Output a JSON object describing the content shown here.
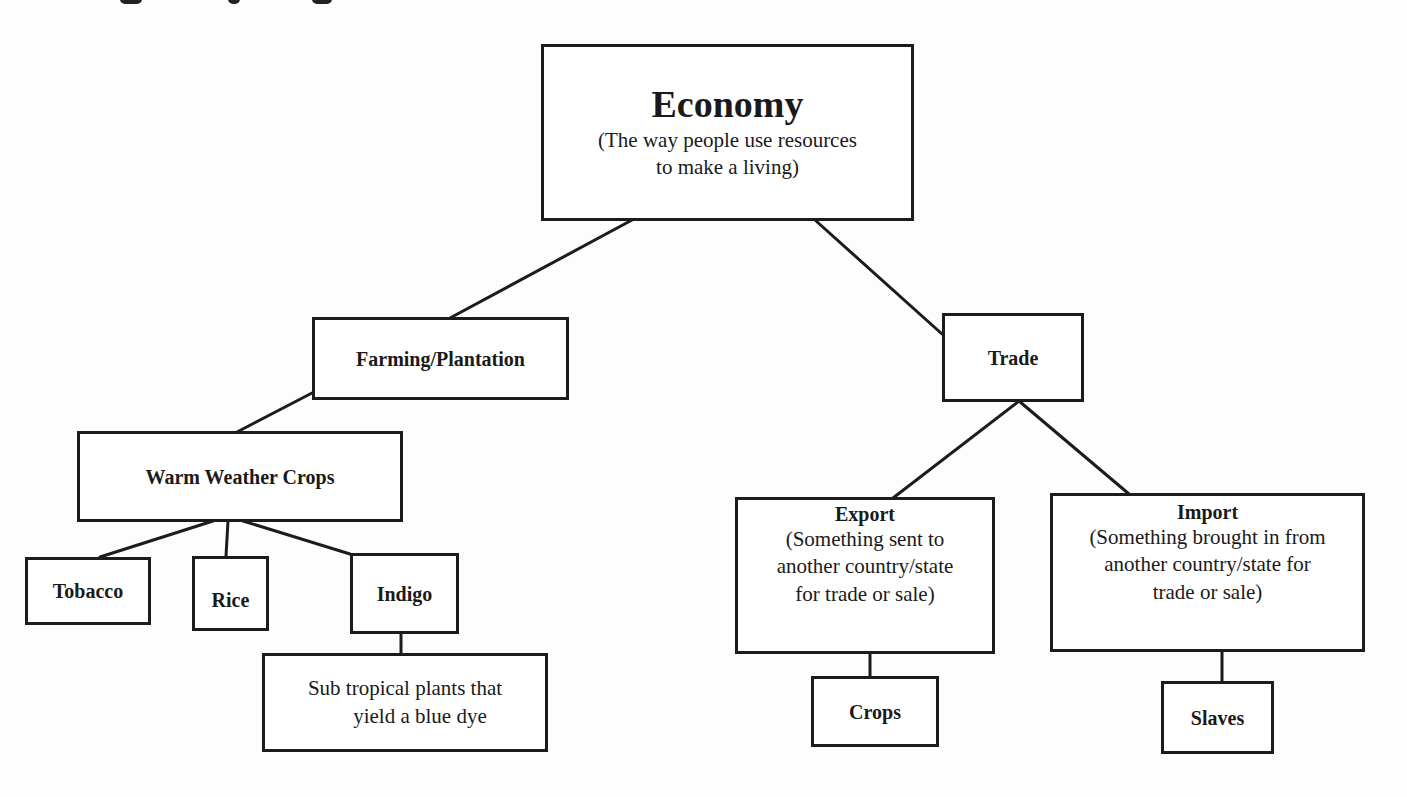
{
  "diagram": {
    "type": "concept-tree",
    "root": {
      "title": "Economy",
      "subtitle_line1": "(The way people use resources",
      "subtitle_line2": "to make a living)"
    },
    "farming": {
      "label": "Farming/Plantation",
      "warm_crops": {
        "label": "Warm Weather Crops",
        "children": [
          {
            "label": "Tobacco"
          },
          {
            "label": "Rice"
          },
          {
            "label": "Indigo"
          }
        ],
        "indigo_note_line1": "Sub tropical plants that",
        "indigo_note_line2": "yield a blue dye"
      }
    },
    "trade": {
      "label": "Trade",
      "export": {
        "title": "Export",
        "line1": "(Something sent to",
        "line2": "another country/state",
        "line3": "for trade or sale)",
        "child": "Crops"
      },
      "import": {
        "title": "Import",
        "line1": "(Something brought in from",
        "line2": "another country/state for",
        "line3": "trade or sale)",
        "child": "Slaves"
      }
    },
    "colors": {
      "line": "#1c1c1c",
      "background": "#fdfdfd"
    }
  }
}
